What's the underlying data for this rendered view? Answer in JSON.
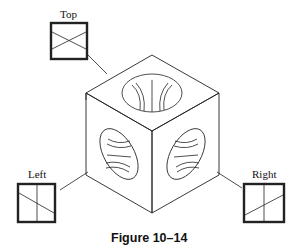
{
  "figure": {
    "caption": "Figure 10–14",
    "views": [
      {
        "id": "top",
        "label": "Top"
      },
      {
        "id": "left",
        "label": "Left"
      },
      {
        "id": "right",
        "label": "Right"
      }
    ]
  }
}
